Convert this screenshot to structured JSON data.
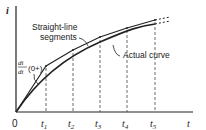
{
  "axes": {
    "y_label": "i",
    "x_label": "t",
    "origin_label": "0"
  },
  "ticks": [
    {
      "label": "t",
      "sub": "1",
      "x": 46
    },
    {
      "label": "t",
      "sub": "2",
      "x": 73
    },
    {
      "label": "t",
      "sub": "3",
      "x": 100
    },
    {
      "label": "t",
      "sub": "4",
      "x": 127
    },
    {
      "label": "t",
      "sub": "5",
      "x": 155
    }
  ],
  "annotations": {
    "straight_line_1": "Straight-line",
    "straight_line_2": "segments",
    "actual_curve": "Actual curve",
    "derivative_num": "di",
    "derivative_den": "dt",
    "derivative_arg": "(0+)"
  },
  "colors": {
    "line": "#222222",
    "background": "#ffffff"
  }
}
